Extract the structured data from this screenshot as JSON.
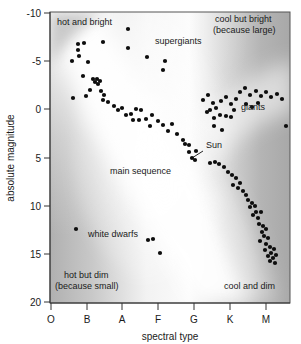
{
  "figure": {
    "background_color": "#ffffff",
    "plot_border_color": "#555555",
    "dot_color": "#0d0d0d"
  },
  "axes": {
    "y": {
      "label": "absolute magnitude",
      "ticks": [
        "-10",
        "-5",
        "0",
        "5",
        "10",
        "15",
        "20"
      ],
      "values": [
        -10,
        -5,
        0,
        5,
        10,
        15,
        20
      ],
      "min": -10,
      "max": 20,
      "inverted": true
    },
    "x": {
      "label": "spectral type",
      "ticks": [
        "O",
        "B",
        "A",
        "F",
        "G",
        "K",
        "M"
      ],
      "min_index": 0,
      "max_index": 6
    }
  },
  "region_labels": [
    {
      "id": "hot-and-bright",
      "text": "hot and bright",
      "x": 57,
      "y": 25
    },
    {
      "id": "cool-but-bright-line1",
      "text": "cool but bright",
      "x": 215,
      "y": 22
    },
    {
      "id": "cool-but-bright-line2",
      "text": "(because large)",
      "x": 213,
      "y": 33
    },
    {
      "id": "hot-but-dim-line1",
      "text": "hot but dim",
      "x": 64,
      "y": 278
    },
    {
      "id": "hot-but-dim-line2",
      "text": "(because small)",
      "x": 55,
      "y": 289
    },
    {
      "id": "cool-and-dim",
      "text": "cool and dim",
      "x": 224,
      "y": 289
    }
  ],
  "feature_labels": [
    {
      "id": "supergiants",
      "text": "supergiants",
      "x": 155,
      "y": 44
    },
    {
      "id": "giants",
      "text": "giants",
      "x": 241,
      "y": 110
    },
    {
      "id": "main-sequence",
      "text": "main sequence",
      "x": 110,
      "y": 174
    },
    {
      "id": "sun",
      "text": "Sun",
      "x": 206,
      "y": 148
    },
    {
      "id": "white-dwarfs",
      "text": "white dwarfs",
      "x": 88,
      "y": 237
    }
  ],
  "annotations": [
    {
      "id": "sun-leader-line",
      "from_x": 203,
      "from_y": 151,
      "to_x": 192,
      "to_y": 158
    }
  ],
  "chart_data": {
    "type": "scatter",
    "xlabel": "spectral type",
    "ylabel": "absolute magnitude",
    "xlim": [
      0,
      6
    ],
    "ylim": [
      20,
      -10
    ],
    "grid": false,
    "legend": null,
    "x_tick_labels": [
      "O",
      "B",
      "A",
      "F",
      "G",
      "K",
      "M"
    ],
    "y_tick_labels": [
      "-10",
      "-5",
      "0",
      "5",
      "10",
      "15",
      "20"
    ],
    "annotations_in_plot": [
      "hot and bright",
      "cool but bright (because large)",
      "hot but dim (because small)",
      "cool and dim",
      "supergiants",
      "giants",
      "main sequence",
      "Sun",
      "white dwarfs"
    ],
    "series": [
      {
        "name": "stars",
        "marker": "circle",
        "color": "#0d0d0d",
        "points_px": [
          [
            128,
            29
          ],
          [
            103,
            42
          ],
          [
            128,
            48
          ],
          [
            78,
            44
          ],
          [
            78,
            50
          ],
          [
            84,
            43
          ],
          [
            79,
            56
          ],
          [
            72,
            61
          ],
          [
            88,
            62
          ],
          [
            147,
            57
          ],
          [
            165,
            61
          ],
          [
            163,
            70
          ],
          [
            83,
            76
          ],
          [
            93,
            79
          ],
          [
            95,
            82
          ],
          [
            97,
            79
          ],
          [
            98,
            84
          ],
          [
            100,
            81
          ],
          [
            90,
            90
          ],
          [
            73,
            98
          ],
          [
            86,
            96
          ],
          [
            101,
            91
          ],
          [
            104,
            95
          ],
          [
            103,
            100
          ],
          [
            108,
            102
          ],
          [
            114,
            106
          ],
          [
            118,
            110
          ],
          [
            122,
            108
          ],
          [
            126,
            115
          ],
          [
            131,
            114
          ],
          [
            136,
            109
          ],
          [
            141,
            110
          ],
          [
            133,
            120
          ],
          [
            139,
            120
          ],
          [
            146,
            119
          ],
          [
            152,
            115
          ],
          [
            158,
            121
          ],
          [
            150,
            126
          ],
          [
            163,
            125
          ],
          [
            168,
            131
          ],
          [
            172,
            124
          ],
          [
            177,
            134
          ],
          [
            183,
            140
          ],
          [
            185,
            144
          ],
          [
            189,
            145
          ],
          [
            192,
            158
          ],
          [
            196,
            151
          ],
          [
            189,
            152
          ],
          [
            195,
            160
          ],
          [
            210,
            163
          ],
          [
            215,
            162
          ],
          [
            219,
            164
          ],
          [
            224,
            167
          ],
          [
            228,
            172
          ],
          [
            232,
            175
          ],
          [
            236,
            178
          ],
          [
            233,
            185
          ],
          [
            238,
            188
          ],
          [
            240,
            183
          ],
          [
            243,
            191
          ],
          [
            246,
            195
          ],
          [
            248,
            200
          ],
          [
            252,
            203
          ],
          [
            250,
            207
          ],
          [
            255,
            206
          ],
          [
            256,
            212
          ],
          [
            253,
            215
          ],
          [
            258,
            218
          ],
          [
            261,
            212
          ],
          [
            259,
            224
          ],
          [
            263,
            226
          ],
          [
            262,
            232
          ],
          [
            266,
            229
          ],
          [
            264,
            236
          ],
          [
            268,
            238
          ],
          [
            260,
            241
          ],
          [
            266,
            244
          ],
          [
            270,
            247
          ],
          [
            265,
            250
          ],
          [
            271,
            253
          ],
          [
            274,
            249
          ],
          [
            268,
            256
          ],
          [
            273,
            258
          ],
          [
            276,
            255
          ],
          [
            270,
            261
          ],
          [
            275,
            263
          ],
          [
            203,
            100
          ],
          [
            208,
            95
          ],
          [
            213,
            103
          ],
          [
            210,
            110
          ],
          [
            216,
            108
          ],
          [
            221,
            101
          ],
          [
            226,
            97
          ],
          [
            231,
            104
          ],
          [
            236,
            99
          ],
          [
            234,
            110
          ],
          [
            220,
            115
          ],
          [
            226,
            116
          ],
          [
            214,
            118
          ],
          [
            231,
            117
          ],
          [
            207,
            112
          ],
          [
            240,
            92
          ],
          [
            245,
            88
          ],
          [
            250,
            95
          ],
          [
            256,
            91
          ],
          [
            261,
            96
          ],
          [
            266,
            92
          ],
          [
            271,
            97
          ],
          [
            277,
            94
          ],
          [
            282,
            99
          ],
          [
            246,
            104
          ],
          [
            252,
            107
          ],
          [
            258,
            103
          ],
          [
            286,
            126
          ],
          [
            222,
            130
          ],
          [
            214,
            126
          ],
          [
            76,
            229
          ],
          [
            148,
            240
          ],
          [
            153,
            239
          ],
          [
            160,
            253
          ]
        ],
        "count": 118
      }
    ],
    "bands": [
      {
        "name": "main sequence band",
        "description": "broad light diagonal band running from upper-left (hot, bright) to lower-right (cool, dim)"
      },
      {
        "name": "giant branch band",
        "description": "light band sweeping to the right toward cool giants"
      }
    ]
  }
}
